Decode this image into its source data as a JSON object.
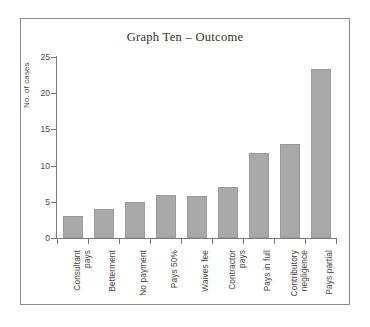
{
  "chart_data": {
    "type": "bar",
    "title": "Graph Ten – Outcome",
    "xlabel": "",
    "ylabel": "No. of cases",
    "ylim": [
      0,
      25
    ],
    "yticks": [
      0,
      5,
      10,
      15,
      20,
      25
    ],
    "grid": false,
    "legend": null,
    "categories": [
      "Consultant\npays",
      "Betterment",
      "No payment",
      "Pays 50%",
      "Waives fee",
      "Contractor\npays",
      "Pays in full",
      "Contributory\nnegligence",
      "Pays partial"
    ],
    "values": [
      3,
      4,
      5,
      6,
      5.8,
      7,
      11.8,
      13,
      23.3
    ],
    "bar_color": "#a9a9a9",
    "axis_color": "#7c7c7c",
    "frame_color": "#8d8d8d",
    "background": "#ffffff"
  }
}
